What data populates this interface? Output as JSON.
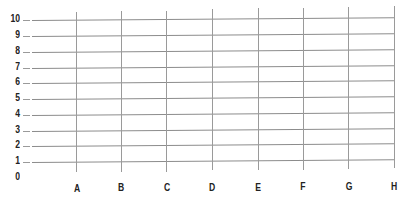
{
  "worksheet": {
    "y_axis": {
      "labels": [
        "10",
        "9",
        "8",
        "7",
        "6",
        "5",
        "4",
        "3",
        "2",
        "1",
        "0"
      ]
    },
    "x_axis": {
      "labels": [
        "A",
        "B",
        "C",
        "D",
        "E",
        "F",
        "G",
        "H"
      ]
    },
    "grid": {
      "rows": 10,
      "columns": 8,
      "line_color": "#8c8c8c",
      "label_color": "#222222",
      "background": "#ffffff"
    }
  }
}
